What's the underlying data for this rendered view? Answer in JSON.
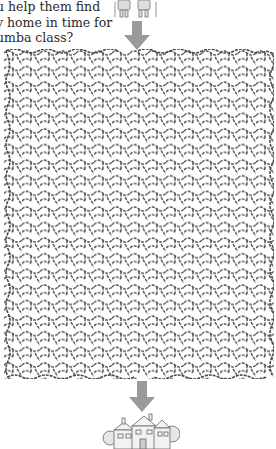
{
  "puzzle": {
    "intro_lines": [
      "u help them find",
      "y home in time for",
      "umba class?"
    ],
    "start_label_icon": "couple-walking-icon",
    "end_label_icon": "house-icon",
    "arrow_color": "#9a9a9a",
    "maze_line_color": "#4a4a4a"
  }
}
